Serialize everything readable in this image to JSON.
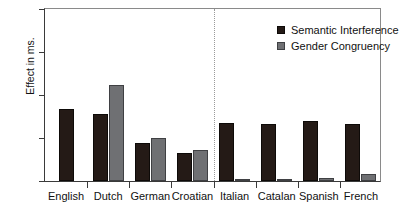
{
  "chart_data": {
    "type": "bar",
    "title": "",
    "xlabel": "",
    "ylabel": "Effect in ms.",
    "ylim": [
      0,
      100
    ],
    "yticks": [
      0,
      25,
      50,
      75,
      100
    ],
    "ytick_labels": [
      "0",
      "25",
      "50",
      "75",
      "100"
    ],
    "grid": false,
    "legend_position": "top-right",
    "categories": [
      "English",
      "Dutch",
      "German",
      "Croatian",
      "Italian",
      "Catalan",
      "Spanish",
      "French"
    ],
    "series": [
      {
        "name": "Semantic Interference",
        "color": "#241a16",
        "values": [
          42,
          39,
          22,
          16,
          34,
          33,
          35,
          33
        ]
      },
      {
        "name": "Gender Congruency",
        "color": "#6f7073",
        "values": [
          null,
          56,
          25,
          18,
          1,
          0.5,
          2,
          4
        ]
      }
    ],
    "annotations": [
      {
        "type": "vertical-divider",
        "label": "group-divider",
        "between": [
          "Croatian",
          "Italian"
        ],
        "style": "dotted"
      }
    ]
  },
  "legend": {
    "items": [
      {
        "label": "Semantic Interference",
        "swatch": "dark"
      },
      {
        "label": "Gender Congruency",
        "swatch": "gray"
      }
    ]
  }
}
